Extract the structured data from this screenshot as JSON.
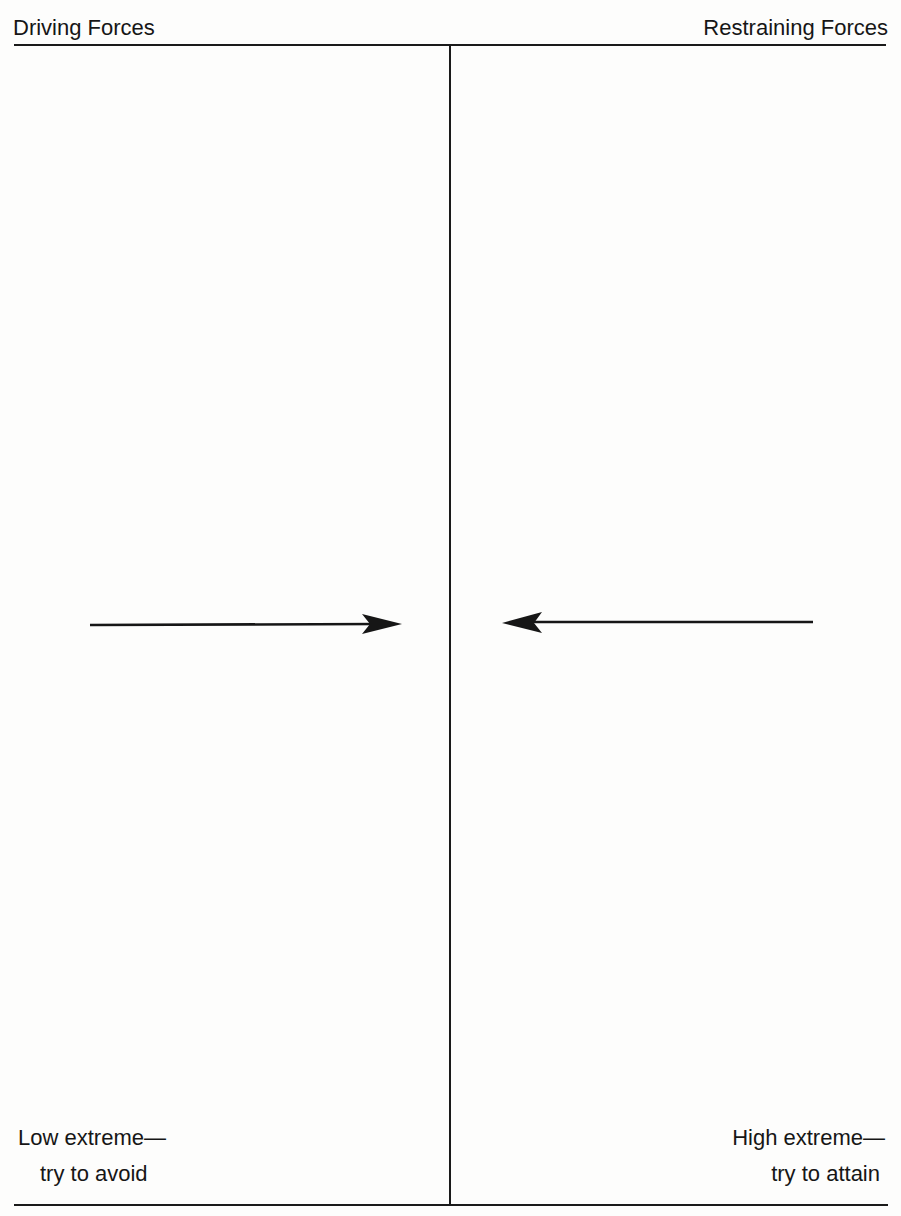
{
  "diagram": {
    "type": "force-field-analysis",
    "header": {
      "left_title": "Driving Forces",
      "right_title": "Restraining Forces"
    },
    "forces": [
      {
        "side": "driving",
        "direction": "right",
        "label": ""
      },
      {
        "side": "restraining",
        "direction": "left",
        "label": ""
      }
    ],
    "footer": {
      "low_extreme": {
        "line1": "Low extreme—",
        "line2": "try to avoid"
      },
      "high_extreme": {
        "line1": "High extreme—",
        "line2": "try to attain"
      },
      "center_label": ""
    },
    "colors": {
      "ink": "#161616",
      "paper": "#fdfdfc"
    }
  }
}
